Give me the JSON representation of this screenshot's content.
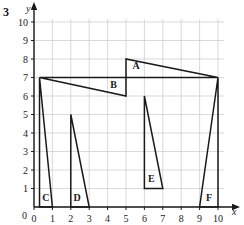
{
  "problem": {
    "number": "3"
  },
  "chart_data": {
    "type": "scatter",
    "title": "",
    "xlabel": "x",
    "ylabel": "y",
    "xlim": [
      0,
      10
    ],
    "ylim": [
      0,
      10
    ],
    "grid": true,
    "grid_color": "#c8c8d0",
    "axis_color": "#1a1a1a",
    "shape_color": "#1a1a1a",
    "xticks": [
      "0",
      "1",
      "2",
      "3",
      "4",
      "5",
      "6",
      "7",
      "8",
      "9",
      "10"
    ],
    "yticks": [
      "0",
      "1",
      "2",
      "3",
      "4",
      "5",
      "6",
      "7",
      "8",
      "9",
      "10"
    ],
    "shapes": [
      {
        "label": "A",
        "points": [
          [
            5,
            8
          ],
          [
            5,
            7
          ],
          [
            10,
            7
          ]
        ],
        "label_pos": [
          5.35,
          7.45
        ]
      },
      {
        "label": "B",
        "points": [
          [
            0.3,
            7
          ],
          [
            5,
            7
          ],
          [
            5,
            6
          ]
        ],
        "label_pos": [
          4.15,
          6.45
        ]
      },
      {
        "label": "C",
        "points": [
          [
            0.3,
            7
          ],
          [
            0.3,
            0
          ],
          [
            1,
            0
          ]
        ],
        "label_pos": [
          0.45,
          0.35
        ]
      },
      {
        "label": "D",
        "points": [
          [
            2,
            5
          ],
          [
            2,
            0
          ],
          [
            3,
            0
          ]
        ],
        "label_pos": [
          2.15,
          0.35
        ]
      },
      {
        "label": "E",
        "points": [
          [
            6,
            6
          ],
          [
            6,
            1
          ],
          [
            7,
            1
          ]
        ],
        "label_pos": [
          6.2,
          1.35
        ]
      },
      {
        "label": "F",
        "points": [
          [
            10,
            7
          ],
          [
            10,
            0
          ],
          [
            9,
            0
          ]
        ],
        "label_pos": [
          9.35,
          0.35
        ]
      }
    ]
  }
}
